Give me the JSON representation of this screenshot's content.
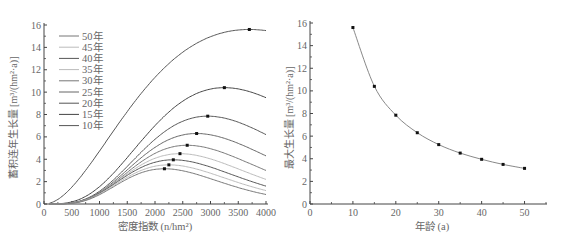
{
  "chart_data": [
    {
      "type": "line",
      "title": "",
      "xlabel": "密度指数 (n/hm²)",
      "ylabel": "蓄积连年生长量 [m³/(hm²·a)]",
      "xlim": [
        0,
        4000
      ],
      "ylim": [
        0,
        16
      ],
      "xticks": [
        "0",
        "500",
        "1000",
        "1500",
        "2000",
        "2500",
        "3000",
        "3500",
        "4000"
      ],
      "yticks": [
        "0",
        "2",
        "4",
        "6",
        "8",
        "10",
        "12",
        "14",
        "16"
      ],
      "grid": false,
      "legend_position": "upper-left",
      "legend": [
        "50年",
        "45年",
        "40年",
        "35年",
        "30年",
        "25年",
        "20年",
        "15年",
        "10年"
      ],
      "series": [
        {
          "name": "10年",
          "peak": {
            "x": 3700,
            "y": 15.6
          },
          "end": {
            "x": 4000,
            "y": 15.5
          },
          "start": {
            "x": 100,
            "y": 0.45
          },
          "color": "#555555"
        },
        {
          "name": "15年",
          "peak": {
            "x": 3250,
            "y": 10.4
          },
          "end": {
            "x": 4000,
            "y": 9.5
          },
          "start": {
            "x": 100,
            "y": 0.4
          },
          "color": "#444444"
        },
        {
          "name": "20年",
          "peak": {
            "x": 2950,
            "y": 7.85
          },
          "end": {
            "x": 4000,
            "y": 6.2
          },
          "start": {
            "x": 100,
            "y": 0.38
          },
          "color": "#555555"
        },
        {
          "name": "25年",
          "peak": {
            "x": 2750,
            "y": 6.3
          },
          "end": {
            "x": 4000,
            "y": 4.3
          },
          "start": {
            "x": 100,
            "y": 0.36
          },
          "color": "#666666"
        },
        {
          "name": "30年",
          "peak": {
            "x": 2580,
            "y": 5.25
          },
          "end": {
            "x": 4000,
            "y": 3.0
          },
          "start": {
            "x": 100,
            "y": 0.34
          },
          "color": "#777777"
        },
        {
          "name": "35年",
          "peak": {
            "x": 2450,
            "y": 4.5
          },
          "end": {
            "x": 4000,
            "y": 2.2
          },
          "start": {
            "x": 100,
            "y": 0.32
          },
          "color": "#bbbbbb"
        },
        {
          "name": "40年",
          "peak": {
            "x": 2330,
            "y": 3.95
          },
          "end": {
            "x": 4000,
            "y": 1.6
          },
          "start": {
            "x": 100,
            "y": 0.3
          },
          "color": "#555555"
        },
        {
          "name": "45年",
          "peak": {
            "x": 2250,
            "y": 3.5
          },
          "end": {
            "x": 4000,
            "y": 1.2
          },
          "start": {
            "x": 100,
            "y": 0.28
          },
          "color": "#bbbbbb"
        },
        {
          "name": "50年",
          "peak": {
            "x": 2170,
            "y": 3.15
          },
          "end": {
            "x": 4000,
            "y": 0.85
          },
          "start": {
            "x": 100,
            "y": 0.26
          },
          "color": "#777777"
        }
      ]
    },
    {
      "type": "line",
      "title": "",
      "xlabel": "年龄 (a)",
      "ylabel": "最大生长量 [m³/(hm²·a)]",
      "xlim": [
        0,
        55
      ],
      "ylim": [
        0,
        16
      ],
      "xticks": [
        "0",
        "10",
        "20",
        "30",
        "40",
        "50"
      ],
      "yticks": [
        "0",
        "2",
        "4",
        "6",
        "8",
        "10",
        "12",
        "14",
        "16"
      ],
      "grid": false,
      "x": [
        10,
        15,
        20,
        25,
        30,
        35,
        40,
        45,
        50
      ],
      "series": [
        {
          "name": "最大生长量",
          "values": [
            15.6,
            10.4,
            7.85,
            6.3,
            5.25,
            4.5,
            3.95,
            3.5,
            3.15
          ],
          "color": "#888888",
          "marker": "square"
        }
      ]
    }
  ],
  "left": {
    "ylabel": "蓄积连年生长量 [m³/(hm²·a)]",
    "xlabel_cn": "密度指数",
    "xlabel_unit": "(n/hm²)"
  },
  "right": {
    "ylabel": "最大生长量 [m³/(hm²·a)]",
    "xlabel": "年龄 (a)"
  }
}
